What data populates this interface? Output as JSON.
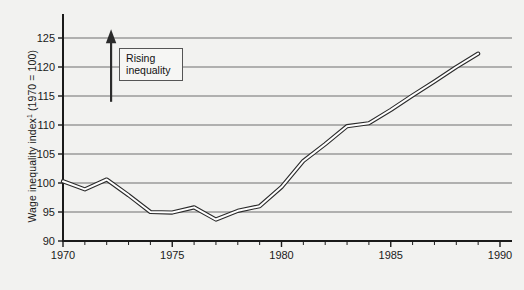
{
  "chart_data": {
    "type": "line",
    "title": "",
    "xlabel": "",
    "ylabel": "Wage inequality index¹ (1970 = 100)",
    "ylabel_main": "Wage inequality index",
    "ylabel_sup": "1",
    "ylabel_tail": " (1970 = 100)",
    "xlim": [
      1970,
      1990
    ],
    "ylim": [
      90,
      125
    ],
    "grid": true,
    "legend": "none",
    "y_ticks": [
      90,
      95,
      100,
      105,
      110,
      115,
      120,
      125
    ],
    "x_ticks_major": [
      1970,
      1975,
      1980,
      1985,
      1990
    ],
    "x_ticks_minor": [
      1971,
      1972,
      1973,
      1974,
      1976,
      1977,
      1978,
      1979,
      1981,
      1982,
      1983,
      1984,
      1986,
      1987,
      1988,
      1989
    ],
    "x": [
      1970,
      1971,
      1972,
      1973,
      1974,
      1975,
      1976,
      1977,
      1978,
      1979,
      1980,
      1981,
      1982,
      1983,
      1984,
      1985,
      1986,
      1987,
      1988,
      1989
    ],
    "values": [
      100.3,
      98.9,
      100.6,
      97.9,
      95.0,
      94.9,
      95.8,
      93.7,
      95.2,
      96.0,
      99.3,
      103.8,
      106.7,
      109.8,
      110.3,
      112.6,
      115.1,
      117.5,
      120.0,
      122.3
    ],
    "series": [
      {
        "name": "Wage inequality index",
        "values": [
          100.3,
          98.9,
          100.6,
          97.9,
          95.0,
          94.9,
          95.8,
          93.7,
          95.2,
          96.0,
          99.3,
          103.8,
          106.7,
          109.8,
          110.3,
          112.6,
          115.1,
          117.5,
          120.0,
          122.3
        ]
      }
    ],
    "annotations": [
      {
        "name": "rising-inequality",
        "text_line1": "Rising",
        "text_line2": "inequality",
        "arrow": "up",
        "arrow_from": 114,
        "arrow_to": 126.5,
        "arrow_x": 1972.2
      }
    ],
    "colors": {
      "line_outline": "#2b2b2b",
      "line_fill": "#ffffff",
      "grid": "#6f6f6f",
      "axis": "#1a1a1a",
      "background": "#f2f2f0",
      "annotation_box": "#f6f6f4",
      "annotation_border": "#555555"
    }
  },
  "axes": {
    "y_tick_labels": [
      "125",
      "120",
      "115",
      "110",
      "105",
      "100",
      "95",
      "90"
    ],
    "x_tick_labels": [
      "1970",
      "1975",
      "1980",
      "1985",
      "1990"
    ]
  }
}
